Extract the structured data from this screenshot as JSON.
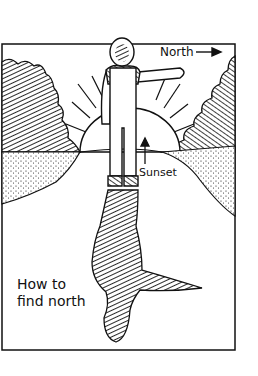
{
  "illustration": {
    "caption": [
      "How to",
      "find north"
    ],
    "labels": {
      "north": "North",
      "sunset": "Sunset"
    },
    "style": "black ink line drawing on white",
    "colors": {
      "ink": "#111111",
      "paper": "#ffffff"
    }
  }
}
